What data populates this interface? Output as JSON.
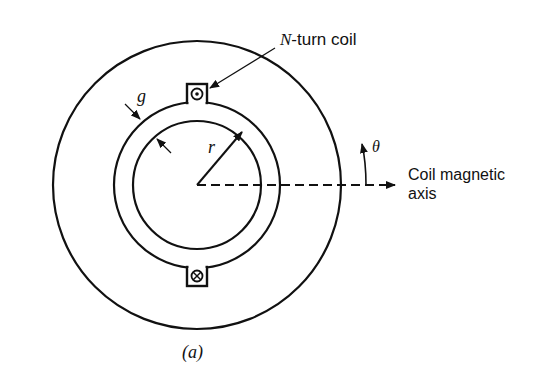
{
  "figure": {
    "caption": "(a)",
    "labels": {
      "coil": "N-turn coil",
      "coil_italic": "N",
      "coil_rest": "-turn coil",
      "gap": "g",
      "radius": "r",
      "angle": "θ",
      "axis_line1": "Coil magnetic",
      "axis_line2": "axis"
    },
    "symbols": {
      "top_conductor": "dot (current out of page)",
      "bottom_conductor": "cross (current into page)"
    },
    "colors": {
      "stroke": "#111111",
      "background": "#ffffff"
    }
  }
}
